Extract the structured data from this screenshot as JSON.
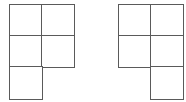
{
  "diagram": {
    "cell_size": 33,
    "line_color": "#5a5a5a",
    "figures": [
      {
        "name": "left-shape",
        "origin": [
          9,
          4
        ],
        "cells": [
          [
            0,
            0
          ],
          [
            1,
            0
          ],
          [
            0,
            1
          ],
          [
            1,
            1
          ],
          [
            0,
            2
          ]
        ]
      },
      {
        "name": "right-shape",
        "origin": [
          118,
          4
        ],
        "cells": [
          [
            0,
            0
          ],
          [
            1,
            0
          ],
          [
            0,
            1
          ],
          [
            1,
            1
          ],
          [
            1,
            2
          ]
        ]
      }
    ]
  }
}
